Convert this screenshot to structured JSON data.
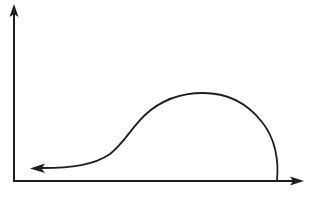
{
  "diagram": {
    "type": "curve-sketch",
    "colors": {
      "background": "#ffffff",
      "stroke": "#1e1e1e"
    },
    "axes": {
      "x_axis": {
        "label": "",
        "direction": "right",
        "arrow": true
      },
      "y_axis": {
        "label": "",
        "direction": "up",
        "arrow": true
      }
    },
    "curve": {
      "description": "Curve starts at the x-axis on the far right, rises as a rounded hump to a peak, descends via an S-shaped inflection, and ends in a leftward-pointing arrow just above the x-axis near the origin.",
      "start": "right, on x-axis",
      "end": "left, near origin, arrowhead pointing left",
      "arrow": true
    },
    "labels": []
  }
}
